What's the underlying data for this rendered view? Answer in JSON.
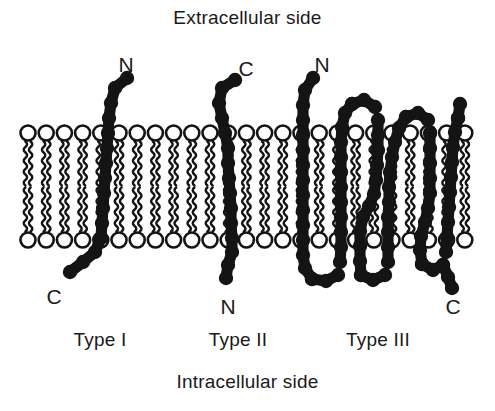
{
  "labels": {
    "extracellular": "Extracellular side",
    "intracellular": "Intracellular side"
  },
  "types": [
    {
      "id": "type-i",
      "label": "Type I",
      "x": 100,
      "y": 330
    },
    {
      "id": "type-ii",
      "label": "Type II",
      "x": 238,
      "y": 330
    },
    {
      "id": "type-iii",
      "label": "Type III",
      "x": 378,
      "y": 330
    }
  ],
  "termini": [
    {
      "id": "type-i-n-terminus",
      "text": "N",
      "x": 126,
      "y": 54,
      "protein": "Type I",
      "side": "extracellular"
    },
    {
      "id": "type-i-c-terminus",
      "text": "C",
      "x": 54,
      "y": 286,
      "protein": "Type I",
      "side": "intracellular"
    },
    {
      "id": "type-ii-c-terminus",
      "text": "C",
      "x": 246,
      "y": 58,
      "protein": "Type II",
      "side": "extracellular"
    },
    {
      "id": "type-ii-n-terminus",
      "text": "N",
      "x": 228,
      "y": 296,
      "protein": "Type II",
      "side": "intracellular"
    },
    {
      "id": "type-iii-n-terminus",
      "text": "N",
      "x": 322,
      "y": 54,
      "protein": "Type III",
      "side": "extracellular"
    },
    {
      "id": "type-iii-c-terminus",
      "text": "C",
      "x": 453,
      "y": 296,
      "protein": "Type III",
      "side": "intracellular"
    }
  ],
  "colors": {
    "protein": "#141414",
    "lipid": "#141414",
    "background": "#ffffff",
    "text": "#1a1a1a"
  },
  "membrane": {
    "left": 28,
    "right": 470,
    "outer_head_y": 133,
    "inner_head_y": 240,
    "head_radius": 7.5,
    "lipid_spacing": 18.2,
    "tail_length": 42
  },
  "proteins": {
    "type_i": {
      "description": "Single-pass, N-terminus extracellular, C-terminus intracellular",
      "bead_radius": 7.2,
      "path": [
        [
          127,
          78
        ],
        [
          115,
          88
        ],
        [
          111,
          103
        ],
        [
          109,
          118
        ],
        [
          108,
          133
        ],
        [
          107,
          148
        ],
        [
          106,
          163
        ],
        [
          105,
          178
        ],
        [
          104,
          193
        ],
        [
          103,
          208
        ],
        [
          102,
          223
        ],
        [
          101,
          238
        ],
        [
          95,
          252
        ],
        [
          83,
          262
        ],
        [
          70,
          272
        ]
      ]
    },
    "type_ii": {
      "description": "Single-pass, C-terminus extracellular, N-terminus intracellular",
      "bead_radius": 7.2,
      "path": [
        [
          235,
          80
        ],
        [
          222,
          88
        ],
        [
          219,
          103
        ],
        [
          222,
          118
        ],
        [
          225,
          133
        ],
        [
          228,
          148
        ],
        [
          228,
          163
        ],
        [
          229,
          178
        ],
        [
          230,
          193
        ],
        [
          231,
          208
        ],
        [
          231,
          223
        ],
        [
          232,
          238
        ],
        [
          232,
          252
        ],
        [
          228,
          265
        ],
        [
          226,
          278
        ]
      ]
    },
    "type_iii": {
      "description": "Multi-pass (six transmembrane segments), N-terminus extracellular, C-terminus intracellular",
      "bead_radius": 7.2,
      "segments": [
        {
          "name": "tm1",
          "path": [
            [
              313,
              78
            ],
            [
              305,
              90
            ],
            [
              303,
              105
            ],
            [
              303,
              120
            ],
            [
              303,
              135
            ],
            [
              303,
              150
            ],
            [
              303,
              165
            ],
            [
              303,
              180
            ],
            [
              303,
              195
            ],
            [
              303,
              210
            ],
            [
              303,
              225
            ],
            [
              303,
              240
            ],
            [
              303,
              255
            ],
            [
              305,
              268
            ],
            [
              312,
              279
            ]
          ]
        },
        {
          "name": "loop1-intracellular",
          "path": [
            [
              312,
              279
            ],
            [
              326,
              281
            ],
            [
              338,
              275
            ]
          ]
        },
        {
          "name": "tm2",
          "path": [
            [
              340,
              262
            ],
            [
              341,
              247
            ],
            [
              341,
              232
            ],
            [
              341,
              217
            ],
            [
              341,
              202
            ],
            [
              341,
              187
            ],
            [
              341,
              172
            ],
            [
              341,
              157
            ],
            [
              341,
              142
            ],
            [
              342,
              127
            ],
            [
              345,
              113
            ],
            [
              352,
              104
            ]
          ]
        },
        {
          "name": "loop2-extracellular",
          "path": [
            [
              352,
              104
            ],
            [
              364,
              100
            ],
            [
              375,
              107
            ]
          ]
        },
        {
          "name": "tm3",
          "path": [
            [
              378,
              120
            ],
            [
              378,
              135
            ],
            [
              378,
              150
            ],
            [
              377,
              165
            ],
            [
              376,
              180
            ],
            [
              374,
              194
            ],
            [
              369,
              206
            ],
            [
              363,
              217
            ],
            [
              360,
              231
            ],
            [
              360,
              246
            ],
            [
              360,
              261
            ],
            [
              361,
              275
            ]
          ]
        },
        {
          "name": "loop3-intracellular",
          "path": [
            [
              361,
              275
            ],
            [
              373,
              280
            ],
            [
              385,
              275
            ]
          ]
        },
        {
          "name": "tm4",
          "path": [
            [
              388,
              262
            ],
            [
              388,
              247
            ],
            [
              388,
              232
            ],
            [
              388,
              217
            ],
            [
              389,
              202
            ],
            [
              389,
              187
            ],
            [
              390,
              172
            ],
            [
              392,
              157
            ],
            [
              395,
              142
            ],
            [
              399,
              128
            ],
            [
              406,
              117
            ]
          ]
        },
        {
          "name": "loop4-extracellular",
          "path": [
            [
              406,
              117
            ],
            [
              418,
              113
            ],
            [
              428,
              120
            ]
          ]
        },
        {
          "name": "tm5",
          "path": [
            [
              430,
              133
            ],
            [
              430,
              148
            ],
            [
              430,
              163
            ],
            [
              430,
              178
            ],
            [
              430,
              193
            ],
            [
              428,
              208
            ],
            [
              425,
              222
            ],
            [
              421,
              236
            ],
            [
              420,
              250
            ],
            [
              422,
              264
            ]
          ]
        },
        {
          "name": "loop5-intracellular",
          "path": [
            [
              422,
              264
            ],
            [
              433,
              270
            ],
            [
              443,
              265
            ]
          ]
        },
        {
          "name": "tm6",
          "path": [
            [
              446,
              252
            ],
            [
              447,
              237
            ],
            [
              448,
              222
            ],
            [
              449,
              207
            ],
            [
              450,
              192
            ],
            [
              451,
              177
            ],
            [
              452,
              162
            ],
            [
              453,
              147
            ],
            [
              455,
              132
            ],
            [
              458,
              118
            ]
          ]
        },
        {
          "name": "tm6-upper",
          "path": [
            [
              458,
              118
            ],
            [
              460,
              104
            ]
          ]
        },
        {
          "name": "c-tail",
          "path": [
            [
              443,
              265
            ],
            [
              448,
              277
            ],
            [
              452,
              288
            ]
          ]
        }
      ]
    }
  }
}
